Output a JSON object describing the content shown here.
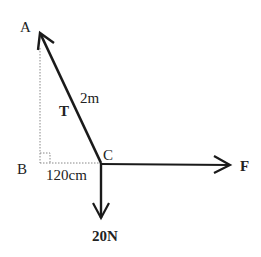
{
  "diagram": {
    "points": {
      "A": {
        "label": "A"
      },
      "B": {
        "label": "B"
      },
      "C": {
        "label": "C"
      }
    },
    "labels": {
      "tension": "T",
      "length_AC": "2m",
      "length_BC": "120cm",
      "force_F": "F",
      "weight": "20N"
    },
    "colors": {
      "line": "#1a1a1a",
      "dotted": "#888888",
      "text": "#222222",
      "background": "#ffffff"
    }
  }
}
